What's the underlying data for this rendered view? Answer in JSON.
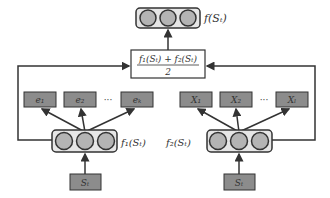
{
  "output_node": {
    "label": "f(S_t)",
    "display": "f(Sₜ)"
  },
  "average_box": {
    "numerator": "f₁(Sₜ) + f₂(Sₜ)",
    "denominator": "2"
  },
  "left_branch": {
    "network_label": "f₁(Sₜ)",
    "input_label": "Sₜ",
    "outputs": [
      "e₁",
      "e₂",
      "eₖ"
    ],
    "ellipsis": "···"
  },
  "right_branch": {
    "network_label": "f₂(Sₜ)",
    "input_label": "Sₜ",
    "outputs": [
      "X₁",
      "X₂",
      "Xₗ"
    ],
    "ellipsis": "···"
  },
  "colors": {
    "node_fill": "#b4b4b4",
    "box_fill": "#8c8c8c",
    "frame_fill": "#e6e6e6",
    "stroke": "#333333"
  }
}
